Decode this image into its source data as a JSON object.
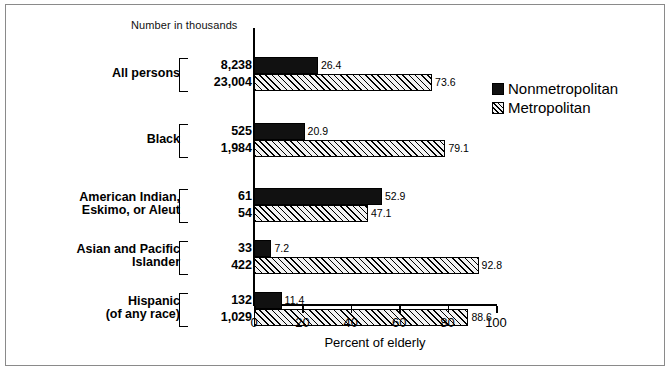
{
  "figure": {
    "header_note": "Number in thousands",
    "xlabel": "Percent of elderly"
  },
  "legend": {
    "items": [
      {
        "label": "Nonmetropolitan",
        "swatch": "black-solid-swatch"
      },
      {
        "label": "Metropolitan",
        "swatch": "hatched-swatch"
      }
    ]
  },
  "axis": {
    "ticks": [
      "0",
      "20",
      "40",
      "60",
      "80",
      "100"
    ]
  },
  "groups": [
    {
      "name_lines": [
        "All persons"
      ],
      "counts": [
        "8,238",
        "23,004"
      ],
      "nonmetro_pct": "26.4",
      "metro_pct": "73.6"
    },
    {
      "name_lines": [
        "Black"
      ],
      "counts": [
        "525",
        "1,984"
      ],
      "nonmetro_pct": "20.9",
      "metro_pct": "79.1"
    },
    {
      "name_lines": [
        "American Indian,",
        "Eskimo, or Aleut"
      ],
      "counts": [
        "61",
        "54"
      ],
      "nonmetro_pct": "52.9",
      "metro_pct": "47.1"
    },
    {
      "name_lines": [
        "Asian and Pacific",
        "Islander"
      ],
      "counts": [
        "33",
        "422"
      ],
      "nonmetro_pct": "7.2",
      "metro_pct": "92.8"
    },
    {
      "name_lines": [
        "Hispanic",
        "(of any race)"
      ],
      "counts": [
        "132",
        "1,029"
      ],
      "nonmetro_pct": "11.4",
      "metro_pct": "88.6"
    }
  ],
  "chart_data": {
    "type": "bar",
    "orientation": "horizontal",
    "title": "",
    "subtitle": "Number in thousands",
    "xlabel": "Percent of elderly",
    "ylabel": "",
    "xlim": [
      0,
      100
    ],
    "xticks": [
      0,
      20,
      40,
      60,
      80,
      100
    ],
    "grid": false,
    "legend_position": "right",
    "categories": [
      "All persons",
      "Black",
      "American Indian, Eskimo, or Aleut",
      "Asian and Pacific Islander",
      "Hispanic (of any race)"
    ],
    "series": [
      {
        "name": "Nonmetropolitan",
        "values": [
          26.4,
          20.9,
          52.9,
          7.2,
          11.4
        ],
        "counts_thousands": [
          8238,
          525,
          61,
          33,
          132
        ],
        "color": "#111111",
        "fill": "solid"
      },
      {
        "name": "Metropolitan",
        "values": [
          73.6,
          79.1,
          47.1,
          92.8,
          88.6
        ],
        "counts_thousands": [
          23004,
          1984,
          54,
          422,
          1029
        ],
        "color": "#f2f2f2",
        "fill": "diagonal-hatch"
      }
    ]
  }
}
